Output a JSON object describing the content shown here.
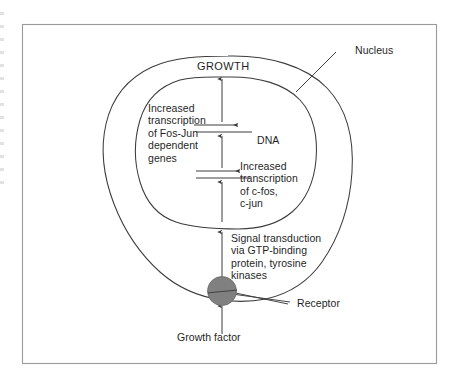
{
  "figure": {
    "type": "cell-signaling-diagram",
    "background_color": "#ffffff",
    "frame_color": "#9a9a9a",
    "line_color": "#3c3c3c",
    "receptor_fill": "#808080",
    "text_color": "#1f1f1f"
  },
  "labels": {
    "growth": "GROWTH",
    "nucleus": "Nucleus",
    "dna": "DNA",
    "receptor": "Receptor",
    "growth_factor": "Growth factor",
    "fos_jun_transcription": "Increased\ntranscription\nof Fos-Jun\ndependent\ngenes",
    "cfos_cjun_transcription": "Increased\ntranscription\nof c-fos,\nc-jun",
    "signal_transduction": "Signal transduction\nvia GTP-binding\nprotein, tyrosine\nkinases"
  },
  "structures": {
    "cell_membrane": "outer cell boundary",
    "nuclear_envelope": "inner nucleus boundary",
    "receptor_circle": "membrane-spanning receptor",
    "dna_strand_upper": "DNA line for Fos-Jun dependent genes",
    "dna_strand_lower": "DNA line for c-fos, c-jun",
    "arrows": [
      "growth factor to receptor",
      "receptor to nucleus (signal transduction)",
      "to c-fos c-jun DNA",
      "c-fos c-jun transcription output",
      "to Fos-Jun dependent DNA",
      "Fos-Jun transcription output",
      "to GROWTH"
    ]
  }
}
